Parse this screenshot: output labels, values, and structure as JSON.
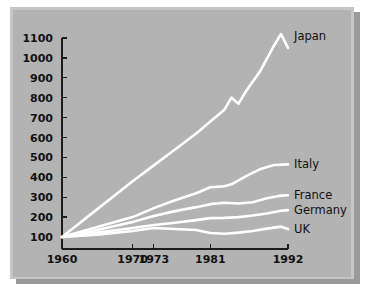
{
  "chart_data": {
    "type": "line",
    "title": "",
    "subtitle": "",
    "xlabel": "",
    "ylabel": "",
    "xlim": [
      1960,
      1992
    ],
    "ylim": [
      100,
      1100
    ],
    "grid": false,
    "legend_position": "right-inline-labels",
    "x_ticks": [
      1960,
      1970,
      1973,
      1981,
      1992
    ],
    "x_tick_labels": [
      "1960",
      "1970",
      "1973",
      "1981",
      "1992"
    ],
    "y_ticks": [
      100,
      200,
      300,
      400,
      500,
      600,
      700,
      800,
      900,
      1000,
      1100
    ],
    "y_tick_labels": [
      "100",
      "200",
      "300",
      "400",
      "500",
      "600",
      "700",
      "800",
      "900",
      "1000",
      "1100"
    ],
    "series": [
      {
        "name": "Japan",
        "label": "Japan",
        "color": "#ffffff",
        "x": [
          1960,
          1965,
          1970,
          1973,
          1976,
          1979,
          1981,
          1983,
          1984,
          1985,
          1986,
          1988,
          1990,
          1991,
          1992
        ],
        "values": [
          100,
          240,
          380,
          460,
          540,
          620,
          680,
          740,
          800,
          770,
          830,
          930,
          1060,
          1120,
          1050
        ]
      },
      {
        "name": "Italy",
        "label": "Italy",
        "color": "#ffffff",
        "x": [
          1960,
          1965,
          1970,
          1973,
          1976,
          1979,
          1981,
          1983,
          1984,
          1986,
          1988,
          1990,
          1992
        ],
        "values": [
          100,
          150,
          200,
          245,
          285,
          320,
          350,
          355,
          365,
          405,
          440,
          462,
          465
        ]
      },
      {
        "name": "France",
        "label": "France",
        "color": "#ffffff",
        "x": [
          1960,
          1965,
          1970,
          1973,
          1976,
          1979,
          1981,
          1983,
          1985,
          1987,
          1989,
          1991,
          1992
        ],
        "values": [
          100,
          135,
          175,
          205,
          230,
          250,
          265,
          272,
          268,
          275,
          295,
          308,
          310
        ]
      },
      {
        "name": "Germany",
        "label": "Germany",
        "color": "#ffffff",
        "x": [
          1960,
          1965,
          1970,
          1973,
          1976,
          1979,
          1981,
          1983,
          1985,
          1987,
          1989,
          1991,
          1992
        ],
        "values": [
          100,
          122,
          145,
          160,
          172,
          185,
          195,
          196,
          200,
          208,
          218,
          232,
          235
        ]
      },
      {
        "name": "UK",
        "label": "UK",
        "color": "#ffffff",
        "x": [
          1960,
          1965,
          1970,
          1973,
          1976,
          1979,
          1981,
          1983,
          1985,
          1987,
          1989,
          1991,
          1992
        ],
        "values": [
          100,
          112,
          130,
          145,
          140,
          135,
          120,
          116,
          122,
          130,
          142,
          152,
          140
        ]
      }
    ],
    "colors": {
      "panel_background": "#b3b3b3",
      "panel_bevel": "#c6c6c6",
      "panel_shadow": "#9a9a9a",
      "page_background": "#ffffff",
      "line_color": "#ffffff",
      "axis_color": "#1c1c1c",
      "text_color": "#111111"
    }
  }
}
